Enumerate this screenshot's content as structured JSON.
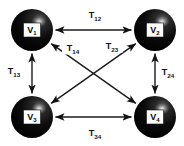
{
  "figure": {
    "type": "directed-graph-diagram",
    "background_color": "#ffffff",
    "node_color": "#080808",
    "edge_color": "#1a1a1a",
    "label_color": "#141414"
  },
  "nodes": [
    {
      "id": "v1",
      "base": "V",
      "sub": "1",
      "x": 32,
      "y": 30,
      "r": 21
    },
    {
      "id": "v2",
      "base": "V",
      "sub": "2",
      "x": 155,
      "y": 30,
      "r": 21
    },
    {
      "id": "v3",
      "base": "V",
      "sub": "3",
      "x": 32,
      "y": 117,
      "r": 21
    },
    {
      "id": "v4",
      "base": "V",
      "sub": "4",
      "x": 155,
      "y": 117,
      "r": 21
    }
  ],
  "edges": [
    {
      "id": "e12",
      "from": "v1",
      "to": "v2",
      "base": "T",
      "sub": "12",
      "label_x": 95,
      "label_y": 15,
      "arrows": "both"
    },
    {
      "id": "e13",
      "from": "v1",
      "to": "v3",
      "base": "T",
      "sub": "13",
      "label_x": 14,
      "label_y": 71,
      "arrows": "both"
    },
    {
      "id": "e14",
      "from": "v1",
      "to": "v4",
      "base": "T",
      "sub": "14",
      "label_x": 73,
      "label_y": 48,
      "arrows": "both"
    },
    {
      "id": "e23",
      "from": "v2",
      "to": "v3",
      "base": "T",
      "sub": "23",
      "label_x": 112,
      "label_y": 46,
      "arrows": "both"
    },
    {
      "id": "e24",
      "from": "v2",
      "to": "v4",
      "base": "T",
      "sub": "24",
      "label_x": 168,
      "label_y": 72,
      "arrows": "both"
    },
    {
      "id": "e34",
      "from": "v3",
      "to": "v4",
      "base": "T",
      "sub": "34",
      "label_x": 95,
      "label_y": 133,
      "arrows": "both"
    }
  ]
}
